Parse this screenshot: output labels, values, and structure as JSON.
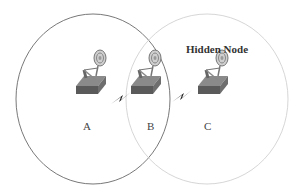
{
  "diagram": {
    "title": "Hidden Node",
    "nodes": [
      {
        "id": "A",
        "label": "A"
      },
      {
        "id": "B",
        "label": "B"
      },
      {
        "id": "C",
        "label": "C"
      }
    ],
    "links": [
      {
        "from": "A",
        "to": "B",
        "icon": "lightning-bolt-icon"
      },
      {
        "from": "B",
        "to": "C",
        "icon": "lightning-bolt-icon"
      }
    ],
    "ranges": [
      {
        "name": "range-A",
        "stroke": "#555555"
      },
      {
        "name": "range-C",
        "stroke": "#cccccc"
      }
    ]
  }
}
